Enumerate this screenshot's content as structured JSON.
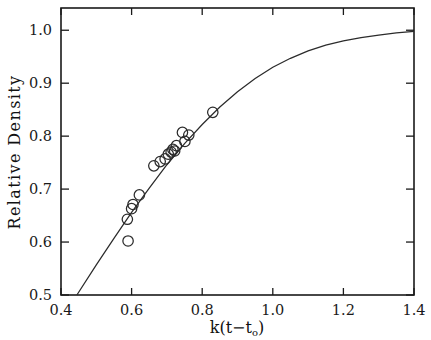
{
  "chart_data": {
    "type": "scatter",
    "title": "",
    "xlabel": "k(t-t_o)",
    "xlabel_parts": {
      "prefix": "k(t",
      "minus": "−",
      "t": "t",
      "subscript": "o",
      "suffix": ")"
    },
    "ylabel": "Relative Density",
    "xlim": [
      0.4,
      1.4
    ],
    "ylim": [
      0.5,
      1.042
    ],
    "xticks": [
      0.4,
      0.6,
      0.8,
      1.0,
      1.2,
      1.4
    ],
    "xticklabels": [
      "0.4",
      "0.6",
      "0.8",
      "1.0",
      "1.2",
      "1.4"
    ],
    "yticks": [
      0.5,
      0.6,
      0.7,
      0.8,
      0.9,
      1.0
    ],
    "yticklabels": [
      "0.5",
      "0.6",
      "0.7",
      "0.8",
      "0.9",
      "1.0"
    ],
    "grid": false,
    "legend": null,
    "tick_direction": "in",
    "frame": "box",
    "marker": "open-circle",
    "marker_size": 5.2,
    "series": [
      {
        "name": "measured relative density",
        "style": "open circles",
        "points": [
          {
            "x": 0.588,
            "y": 0.643
          },
          {
            "x": 0.59,
            "y": 0.602
          },
          {
            "x": 0.6,
            "y": 0.663
          },
          {
            "x": 0.604,
            "y": 0.671
          },
          {
            "x": 0.622,
            "y": 0.689
          },
          {
            "x": 0.663,
            "y": 0.744
          },
          {
            "x": 0.681,
            "y": 0.752
          },
          {
            "x": 0.695,
            "y": 0.757
          },
          {
            "x": 0.704,
            "y": 0.766
          },
          {
            "x": 0.712,
            "y": 0.77
          },
          {
            "x": 0.717,
            "y": 0.775
          },
          {
            "x": 0.722,
            "y": 0.772
          },
          {
            "x": 0.727,
            "y": 0.782
          },
          {
            "x": 0.744,
            "y": 0.807
          },
          {
            "x": 0.751,
            "y": 0.79
          },
          {
            "x": 0.762,
            "y": 0.802
          },
          {
            "x": 0.83,
            "y": 0.845
          }
        ]
      },
      {
        "name": "fitted curve",
        "style": "solid line",
        "description": "monotonic saturating fit rising from 0.50 at x=0.445 to an asymptote near 1.00",
        "curve_points": [
          {
            "x": 0.445,
            "y": 0.5
          },
          {
            "x": 0.5,
            "y": 0.557
          },
          {
            "x": 0.55,
            "y": 0.607
          },
          {
            "x": 0.6,
            "y": 0.656
          },
          {
            "x": 0.65,
            "y": 0.702
          },
          {
            "x": 0.7,
            "y": 0.746
          },
          {
            "x": 0.75,
            "y": 0.786
          },
          {
            "x": 0.8,
            "y": 0.822
          },
          {
            "x": 0.85,
            "y": 0.855
          },
          {
            "x": 0.9,
            "y": 0.884
          },
          {
            "x": 0.95,
            "y": 0.909
          },
          {
            "x": 1.0,
            "y": 0.93
          },
          {
            "x": 1.05,
            "y": 0.947
          },
          {
            "x": 1.1,
            "y": 0.961
          },
          {
            "x": 1.15,
            "y": 0.972
          },
          {
            "x": 1.2,
            "y": 0.98
          },
          {
            "x": 1.25,
            "y": 0.986
          },
          {
            "x": 1.3,
            "y": 0.991
          },
          {
            "x": 1.35,
            "y": 0.995
          },
          {
            "x": 1.4,
            "y": 0.998
          }
        ]
      }
    ],
    "colors": {
      "axis": "#1a1a1a",
      "curve": "#2b2b2b",
      "marker": "#2b2b2b",
      "background": "#ffffff"
    }
  }
}
